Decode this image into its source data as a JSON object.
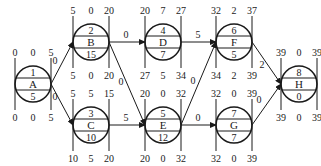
{
  "nodes": [
    {
      "id": "A",
      "top": "1",
      "bottom": "5",
      "es": "0",
      "tf": "0",
      "ef": "5",
      "ls": "0",
      "ff": "0",
      "lf": "5"
    },
    {
      "id": "B",
      "top": "2",
      "bottom": "15",
      "es": "5",
      "tf": "0",
      "ef": "20",
      "ls": "5",
      "ff": "0",
      "lf": "20"
    },
    {
      "id": "C",
      "top": "3",
      "bottom": "10",
      "es": "5",
      "tf": "5",
      "ef": "15",
      "ls": "10",
      "ff": "5",
      "lf": "20"
    },
    {
      "id": "D",
      "top": "4",
      "bottom": "7",
      "es": "20",
      "tf": "7",
      "ef": "27",
      "ls": "27",
      "ff": "5",
      "lf": "34"
    },
    {
      "id": "E",
      "top": "5",
      "bottom": "12",
      "es": "20",
      "tf": "0",
      "ef": "32",
      "ls": "20",
      "ff": "0",
      "lf": "32"
    },
    {
      "id": "F",
      "top": "6",
      "bottom": "5",
      "es": "32",
      "tf": "2",
      "ef": "37",
      "ls": "34",
      "ff": "2",
      "lf": "39"
    },
    {
      "id": "G",
      "top": "7",
      "bottom": "7",
      "es": "32",
      "tf": "0",
      "ef": "39",
      "ls": "32",
      "ff": "0",
      "lf": "39"
    },
    {
      "id": "H",
      "top": "8",
      "bottom": "0",
      "es": "39",
      "tf": "0",
      "ef": "39",
      "ls": "39",
      "ff": "0",
      "lf": "39"
    }
  ],
  "edges": [
    {
      "from": "A",
      "to": "B",
      "label": "0"
    },
    {
      "from": "A",
      "to": "C",
      "label": "0"
    },
    {
      "from": "B",
      "to": "D",
      "label": "0"
    },
    {
      "from": "B",
      "to": "E",
      "label": "0"
    },
    {
      "from": "C",
      "to": "E",
      "label": "5"
    },
    {
      "from": "D",
      "to": "F",
      "label": "5"
    },
    {
      "from": "E",
      "to": "F",
      "label": "0"
    },
    {
      "from": "E",
      "to": "G",
      "label": "0"
    },
    {
      "from": "F",
      "to": "H",
      "label": "2"
    },
    {
      "from": "G",
      "to": "H",
      "label": "0"
    }
  ]
}
